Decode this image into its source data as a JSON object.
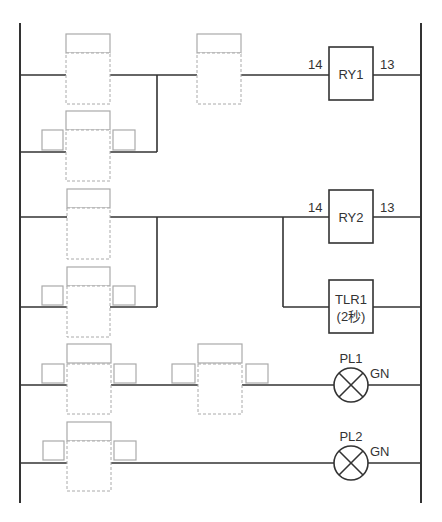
{
  "diagram": {
    "type": "ladder-diagram",
    "colors": {
      "line": "#333333",
      "blank_outline": "#aaaaaa",
      "background": "#ffffff"
    },
    "rungs": [
      {
        "id": "rung-1",
        "coil": {
          "label": "RY1",
          "terminal_left": "14",
          "terminal_right": "13"
        },
        "contacts": [
          "blank-contact-1a",
          "blank-contact-1b",
          "blank-contact-1c (parallel)"
        ]
      },
      {
        "id": "rung-2",
        "coils": [
          {
            "label": "RY2",
            "terminal_left": "14",
            "terminal_right": "13"
          },
          {
            "label": "TLR1",
            "sublabel": "(2秒)"
          }
        ],
        "contacts": [
          "blank-contact-2a",
          "blank-contact-2b (parallel)"
        ]
      },
      {
        "id": "rung-3",
        "lamp": {
          "label": "PL1",
          "color": "GN"
        },
        "contacts": [
          "blank-contact-3a",
          "blank-contact-3b"
        ]
      },
      {
        "id": "rung-4",
        "lamp": {
          "label": "PL2",
          "color": "GN"
        },
        "contacts": [
          "blank-contact-4a"
        ]
      }
    ],
    "labels": {
      "ry1": "RY1",
      "ry1_t14": "14",
      "ry1_t13": "13",
      "ry2": "RY2",
      "ry2_t14": "14",
      "ry2_t13": "13",
      "tlr1": "TLR1",
      "tlr1_time": "(2秒)",
      "pl1": "PL1",
      "pl1_color": "GN",
      "pl2": "PL2",
      "pl2_color": "GN"
    }
  }
}
